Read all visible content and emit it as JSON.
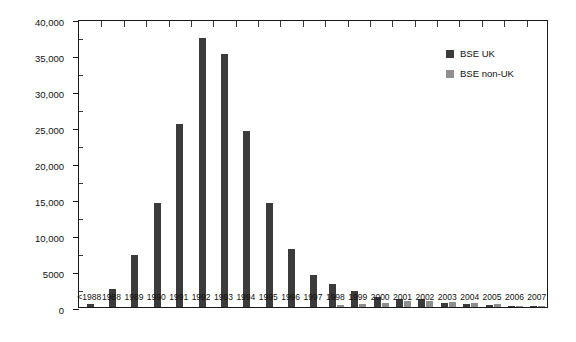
{
  "chart_data": {
    "type": "bar",
    "title": "",
    "xlabel": "",
    "ylabel": "Number of yearly identified infected cows",
    "ylim": [
      0,
      40000
    ],
    "ytick_labels": [
      "0",
      "5000",
      "10,000",
      "15,000",
      "20,000",
      "25,000",
      "30,000",
      "35,000",
      "40,000"
    ],
    "ytick_values": [
      0,
      5000,
      10000,
      15000,
      20000,
      25000,
      30000,
      35000,
      40000
    ],
    "grid": false,
    "legend_position": "top-right",
    "categories": [
      "<1988",
      "1988",
      "1989",
      "1990",
      "1991",
      "1992",
      "1993",
      "1994",
      "1995",
      "1996",
      "1997",
      "1998",
      "1999",
      "2000",
      "2001",
      "2002",
      "2003",
      "2004",
      "2005",
      "2006",
      "2007"
    ],
    "series": [
      {
        "name": "BSE UK",
        "color": "#3b3b3b",
        "values": [
          450,
          2500,
          7200,
          14400,
          25400,
          37300,
          35100,
          24500,
          14500,
          8100,
          4400,
          3200,
          2250,
          1400,
          1150,
          1050,
          600,
          350,
          250,
          110,
          60
        ]
      },
      {
        "name": "BSE non-UK",
        "color": "#8e8e8e",
        "values": [
          0,
          0,
          0,
          0,
          0,
          0,
          0,
          0,
          0,
          0,
          0,
          300,
          380,
          600,
          900,
          850,
          750,
          500,
          400,
          160,
          80
        ]
      }
    ]
  },
  "legend": {
    "items": [
      {
        "label": "BSE UK",
        "color": "#3b3b3b"
      },
      {
        "label": "BSE non-UK",
        "color": "#8e8e8e"
      }
    ]
  }
}
